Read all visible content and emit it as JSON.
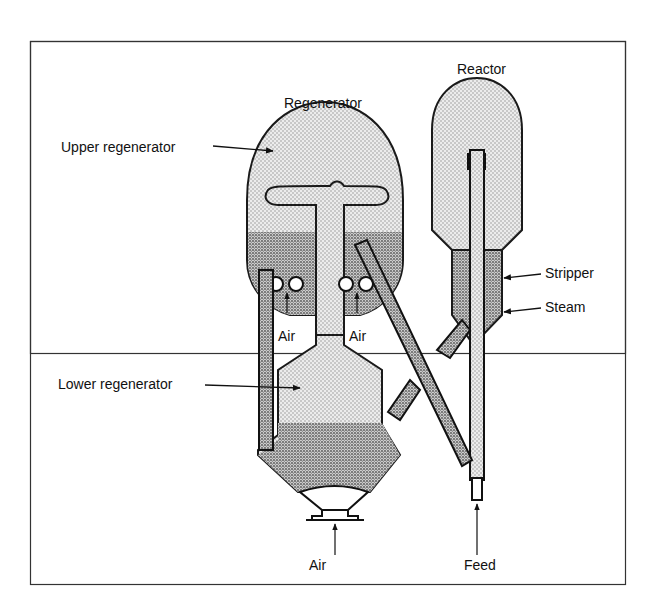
{
  "diagram": {
    "labels": {
      "regenerator": "Regenerator",
      "reactor": "Reactor",
      "upper_regenerator": "Upper regenerator",
      "lower_regenerator": "Lower regenerator",
      "stripper": "Stripper",
      "steam": "Steam",
      "air_left": "Air",
      "air_right": "Air",
      "air_bottom": "Air",
      "feed": "Feed"
    },
    "colors": {
      "line": "#1a1a1a",
      "fill_light": "#d9d9d9",
      "fill_dense": "#a8a8a8",
      "background": "#ffffff"
    }
  }
}
